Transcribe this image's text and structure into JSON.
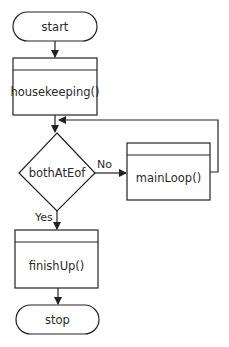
{
  "diagram": {
    "type": "flowchart",
    "nodes": {
      "start": {
        "label": "start",
        "shape": "terminal"
      },
      "housekeeping": {
        "label": "housekeeping()",
        "shape": "predefined-process"
      },
      "decision": {
        "label": "bothAtEof",
        "shape": "decision"
      },
      "mainLoop": {
        "label": "mainLoop()",
        "shape": "predefined-process"
      },
      "finishUp": {
        "label": "finishUp()",
        "shape": "predefined-process"
      },
      "stop": {
        "label": "stop",
        "shape": "terminal"
      }
    },
    "edges": {
      "no": {
        "label": "No",
        "from": "bothAtEof",
        "to": "mainLoop()"
      },
      "yes": {
        "label": "Yes",
        "from": "bothAtEof",
        "to": "finishUp()"
      }
    }
  }
}
